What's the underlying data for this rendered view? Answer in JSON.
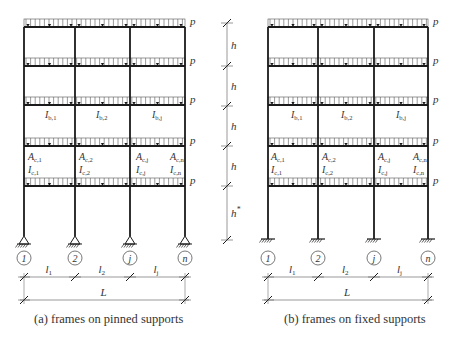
{
  "frames": [
    {
      "id": "a",
      "caption": "(a) frames on pinned supports",
      "support_type": "pinned",
      "columns_x": [
        24,
        75,
        130,
        185
      ],
      "floors_y": [
        27,
        66,
        105,
        146,
        186
      ],
      "base_y": 236,
      "load_label": "p",
      "beam_labels": [
        {
          "text": "I",
          "sub": "b,1",
          "x": 45,
          "y": 118
        },
        {
          "text": "I",
          "sub": "b,2",
          "x": 96,
          "y": 118
        },
        {
          "text": "I",
          "sub": "b,j",
          "x": 152,
          "y": 118
        }
      ],
      "column_labels": [
        {
          "text": "A",
          "sub": "c,1",
          "x": 28,
          "y": 160
        },
        {
          "text": "I",
          "sub": "c,1",
          "x": 28,
          "y": 173
        },
        {
          "text": "A",
          "sub": "c,2",
          "x": 79,
          "y": 160
        },
        {
          "text": "I",
          "sub": "c,2",
          "x": 79,
          "y": 173
        },
        {
          "text": "A",
          "sub": "c,j",
          "x": 136,
          "y": 160
        },
        {
          "text": "I",
          "sub": "c,j",
          "x": 136,
          "y": 173
        },
        {
          "text": "A",
          "sub": "c,n",
          "x": 170,
          "y": 160
        },
        {
          "text": "I",
          "sub": "c,n",
          "x": 170,
          "y": 173
        }
      ],
      "axis_labels": [
        "1",
        "2",
        "j",
        "n"
      ],
      "span_labels": [
        {
          "text": "l",
          "sub": "1"
        },
        {
          "text": "l",
          "sub": "2"
        },
        {
          "text": "l",
          "sub": "j"
        }
      ],
      "total_label": "L"
    },
    {
      "id": "b",
      "caption": "(b) frames on fixed supports",
      "support_type": "fixed",
      "columns_x": [
        268,
        318,
        374,
        428
      ],
      "floors_y": [
        27,
        66,
        105,
        146,
        186
      ],
      "base_y": 239,
      "load_label": "p",
      "beam_labels": [
        {
          "text": "I",
          "sub": "b,1",
          "x": 291,
          "y": 118
        },
        {
          "text": "I",
          "sub": "b,2",
          "x": 341,
          "y": 118
        },
        {
          "text": "I",
          "sub": "b,j",
          "x": 396,
          "y": 118
        }
      ],
      "column_labels": [
        {
          "text": "A",
          "sub": "c,1",
          "x": 271,
          "y": 160
        },
        {
          "text": "I",
          "sub": "c,1",
          "x": 271,
          "y": 173
        },
        {
          "text": "A",
          "sub": "c,2",
          "x": 322,
          "y": 160
        },
        {
          "text": "I",
          "sub": "c,2",
          "x": 322,
          "y": 173
        },
        {
          "text": "A",
          "sub": "c,j",
          "x": 378,
          "y": 160
        },
        {
          "text": "I",
          "sub": "c,j",
          "x": 378,
          "y": 173
        },
        {
          "text": "A",
          "sub": "c,n",
          "x": 413,
          "y": 160
        },
        {
          "text": "I",
          "sub": "c,n",
          "x": 413,
          "y": 173
        }
      ],
      "axis_labels": [
        "1",
        "2",
        "j",
        "n"
      ],
      "span_labels": [
        {
          "text": "l",
          "sub": "1"
        },
        {
          "text": "l",
          "sub": "2"
        },
        {
          "text": "l",
          "sub": "j"
        }
      ],
      "total_label": "L"
    }
  ],
  "height_dimension": {
    "x": 227,
    "ticks_y": [
      23,
      66,
      106,
      146,
      186,
      240
    ],
    "labels": [
      {
        "text": "h",
        "sup": ""
      },
      {
        "text": "h",
        "sup": ""
      },
      {
        "text": "h",
        "sup": ""
      },
      {
        "text": "h",
        "sup": ""
      },
      {
        "text": "h",
        "sup": "*"
      }
    ]
  },
  "colors": {
    "line": "#1a1a1a",
    "thin": "#555555",
    "text": "#333333"
  }
}
